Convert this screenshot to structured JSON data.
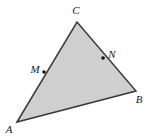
{
  "figure": {
    "type": "geometry-diagram",
    "shape": "triangle",
    "width": 147,
    "height": 138,
    "background_color": "#ffffff",
    "fill_color": "#cfcfcf",
    "stroke_color": "#3a3a3a",
    "stroke_width": 1.5,
    "marker_color": "#111111",
    "marker_radius": 1.8,
    "vertices": [
      {
        "id": "A",
        "label": "A",
        "x": 17,
        "y": 122,
        "label_x": 9,
        "label_y": 130
      },
      {
        "id": "B",
        "label": "B",
        "x": 136,
        "y": 91,
        "label_x": 139,
        "label_y": 100
      },
      {
        "id": "C",
        "label": "C",
        "x": 77,
        "y": 22,
        "label_x": 76,
        "label_y": 11
      }
    ],
    "points": [
      {
        "id": "M",
        "label": "M",
        "on_segment": "AC",
        "x": 44,
        "y": 72,
        "label_x": 35,
        "label_y": 70
      },
      {
        "id": "N",
        "label": "N",
        "on_segment": "CB",
        "x": 103,
        "y": 58,
        "label_x": 112,
        "label_y": 55
      }
    ],
    "segments": [
      {
        "id": "AC",
        "from": "A",
        "to": "C"
      },
      {
        "id": "CB",
        "from": "C",
        "to": "B"
      },
      {
        "id": "BA",
        "from": "B",
        "to": "A"
      }
    ]
  }
}
